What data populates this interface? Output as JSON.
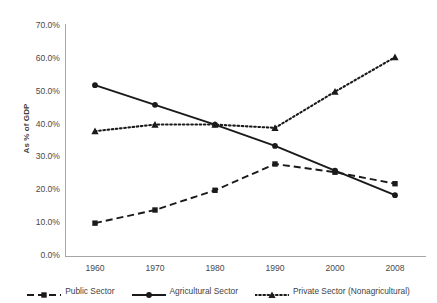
{
  "chart_data": {
    "type": "line",
    "title": "",
    "xlabel": "",
    "ylabel": "As % of GDP",
    "categories": [
      "1960",
      "1970",
      "1980",
      "1990",
      "2000",
      "2008"
    ],
    "ylim": [
      0,
      70
    ],
    "ytick_step": 10,
    "grid": false,
    "legend_position": "bottom",
    "ytick_labels": [
      "70.0%",
      "60.0%",
      "50.0%",
      "40.0%",
      "30.0%",
      "20.0%",
      "10.0%",
      "0.0%"
    ],
    "ytick_values": [
      70,
      60,
      50,
      40,
      30,
      20,
      10,
      0
    ],
    "series": [
      {
        "name": "Public Sector",
        "values": [
          10,
          14,
          20,
          28,
          25.5,
          22
        ],
        "line_style": "dashed",
        "marker": "square",
        "color": "#1a1a1a"
      },
      {
        "name": "Agricultural Sector",
        "values": [
          52,
          46,
          40,
          33.5,
          26,
          18.5
        ],
        "line_style": "solid",
        "marker": "circle",
        "color": "#1a1a1a"
      },
      {
        "name": "Private Sector (Nonagricultural)",
        "values": [
          38,
          40,
          40,
          39,
          50,
          60.5
        ],
        "line_style": "dotted",
        "marker": "triangle",
        "color": "#1a1a1a"
      }
    ]
  },
  "axis": {
    "y_title": "As % of GDP"
  },
  "legend": {
    "items": [
      {
        "label": "Public Sector"
      },
      {
        "label": "Agricultural Sector"
      },
      {
        "label": "Private Sector (Nonagricultural)"
      }
    ]
  }
}
